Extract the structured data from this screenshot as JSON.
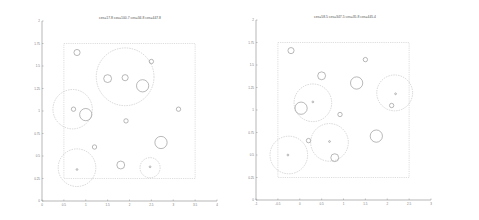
{
  "chart_data": [
    {
      "type": "scatter",
      "title": "ces=17.8 cov=100.7 ces=34.8 ces=447.8",
      "xlabel": "",
      "ylabel": "",
      "xlim": [
        0,
        4
      ],
      "ylim": [
        0,
        2
      ],
      "x_ticks": [
        "0",
        "0.5",
        "1",
        "1.5",
        "2",
        "2.5",
        "3",
        "3.5",
        "4"
      ],
      "y_ticks": [
        "0",
        "0.25",
        "0.5",
        "0.75",
        "1",
        "1.25",
        "1.5",
        "1.75",
        "2"
      ],
      "grid": false,
      "legend": "none",
      "region": {
        "x": [
          0.5,
          3.5
        ],
        "y": [
          0.25,
          1.75
        ]
      },
      "circles": [
        {
          "x": 0.8,
          "y": 1.65,
          "r": 0.07,
          "style": "solid"
        },
        {
          "x": 1.9,
          "y": 1.38,
          "r": 0.66,
          "style": "dashed"
        },
        {
          "x": 1.5,
          "y": 1.36,
          "r": 0.09,
          "style": "solid"
        },
        {
          "x": 1.9,
          "y": 1.37,
          "r": 0.07,
          "style": "solid"
        },
        {
          "x": 2.3,
          "y": 1.28,
          "r": 0.14,
          "style": "solid"
        },
        {
          "x": 2.5,
          "y": 1.55,
          "r": 0.05,
          "style": "solid"
        },
        {
          "x": 0.7,
          "y": 1.02,
          "r": 0.45,
          "style": "dashed"
        },
        {
          "x": 0.72,
          "y": 1.02,
          "r": 0.05,
          "style": "solid"
        },
        {
          "x": 1.0,
          "y": 0.96,
          "r": 0.14,
          "style": "solid"
        },
        {
          "x": 1.92,
          "y": 0.89,
          "r": 0.05,
          "style": "solid"
        },
        {
          "x": 3.12,
          "y": 1.02,
          "r": 0.05,
          "style": "solid"
        },
        {
          "x": 1.2,
          "y": 0.6,
          "r": 0.05,
          "style": "solid"
        },
        {
          "x": 2.72,
          "y": 0.65,
          "r": 0.14,
          "style": "solid"
        },
        {
          "x": 2.47,
          "y": 0.37,
          "r": 0.23,
          "style": "dashed"
        },
        {
          "x": 2.47,
          "y": 0.38,
          "r": 0.02,
          "style": "solid"
        },
        {
          "x": 1.8,
          "y": 0.4,
          "r": 0.09,
          "style": "solid"
        },
        {
          "x": 0.8,
          "y": 0.37,
          "r": 0.43,
          "style": "dashed"
        },
        {
          "x": 0.8,
          "y": 0.35,
          "r": 0.02,
          "style": "solid"
        }
      ]
    },
    {
      "type": "scatter",
      "title": "ces=58.5 ces=347.5 ces=35.8 ces=445.4",
      "xlabel": "",
      "ylabel": "",
      "xlim": [
        -1,
        3
      ],
      "ylim": [
        0,
        2
      ],
      "x_ticks": [
        "-1",
        "-0.5",
        "0",
        "0.5",
        "1",
        "1.5",
        "2",
        "2.5",
        "3"
      ],
      "y_ticks": [
        "0",
        "0.25",
        "0.5",
        "0.75",
        "1",
        "1.25",
        "1.5",
        "1.75",
        "2"
      ],
      "grid": false,
      "legend": "none",
      "region": {
        "x": [
          -0.5,
          2.5
        ],
        "y": [
          0.25,
          1.75
        ]
      },
      "circles": [
        {
          "x": -0.2,
          "y": 1.66,
          "r": 0.07,
          "style": "solid"
        },
        {
          "x": 1.5,
          "y": 1.56,
          "r": 0.05,
          "style": "solid"
        },
        {
          "x": 0.5,
          "y": 1.38,
          "r": 0.09,
          "style": "solid"
        },
        {
          "x": 1.3,
          "y": 1.3,
          "r": 0.14,
          "style": "solid"
        },
        {
          "x": 0.3,
          "y": 1.08,
          "r": 0.43,
          "style": "dashed"
        },
        {
          "x": 0.3,
          "y": 1.09,
          "r": 0.02,
          "style": "solid"
        },
        {
          "x": 0.03,
          "y": 1.02,
          "r": 0.14,
          "style": "solid"
        },
        {
          "x": 2.17,
          "y": 1.19,
          "r": 0.41,
          "style": "dashed"
        },
        {
          "x": 2.19,
          "y": 1.18,
          "r": 0.02,
          "style": "solid"
        },
        {
          "x": 2.1,
          "y": 1.05,
          "r": 0.05,
          "style": "solid"
        },
        {
          "x": 0.92,
          "y": 0.95,
          "r": 0.05,
          "style": "solid"
        },
        {
          "x": 0.2,
          "y": 0.66,
          "r": 0.05,
          "style": "solid"
        },
        {
          "x": 0.68,
          "y": 0.64,
          "r": 0.43,
          "style": "dashed"
        },
        {
          "x": 0.68,
          "y": 0.65,
          "r": 0.02,
          "style": "solid"
        },
        {
          "x": 0.8,
          "y": 0.47,
          "r": 0.09,
          "style": "solid"
        },
        {
          "x": 1.75,
          "y": 0.71,
          "r": 0.14,
          "style": "solid"
        },
        {
          "x": -0.25,
          "y": 0.5,
          "r": 0.43,
          "style": "dashed"
        },
        {
          "x": -0.27,
          "y": 0.5,
          "r": 0.02,
          "style": "solid"
        }
      ]
    }
  ]
}
